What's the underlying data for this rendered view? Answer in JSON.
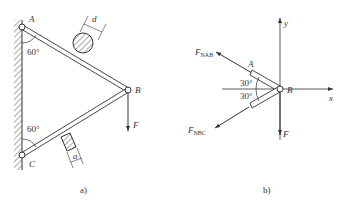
{
  "figure_a": {
    "caption": "a)",
    "labels": {
      "A": "A",
      "B": "B",
      "C": "C",
      "F": "F",
      "d": "d",
      "a": "a"
    },
    "angles": {
      "top": "60°",
      "bottom": "60°"
    },
    "members": [
      {
        "name": "AB",
        "cross_section": "circular",
        "dimension": "d"
      },
      {
        "name": "BC",
        "cross_section": "square",
        "dimension": "a"
      }
    ]
  },
  "figure_b": {
    "caption": "b)",
    "labels": {
      "A": "A",
      "B": "B",
      "x": "x",
      "y": "y",
      "F": "F"
    },
    "forces": {
      "FNAB": {
        "main": "F",
        "sub": "NAB"
      },
      "FNBC": {
        "main": "F",
        "sub": "NBC"
      }
    },
    "angles": {
      "upper": "30°",
      "lower": "30°"
    }
  },
  "colors": {
    "line": "#333333",
    "background": "#ffffff"
  }
}
